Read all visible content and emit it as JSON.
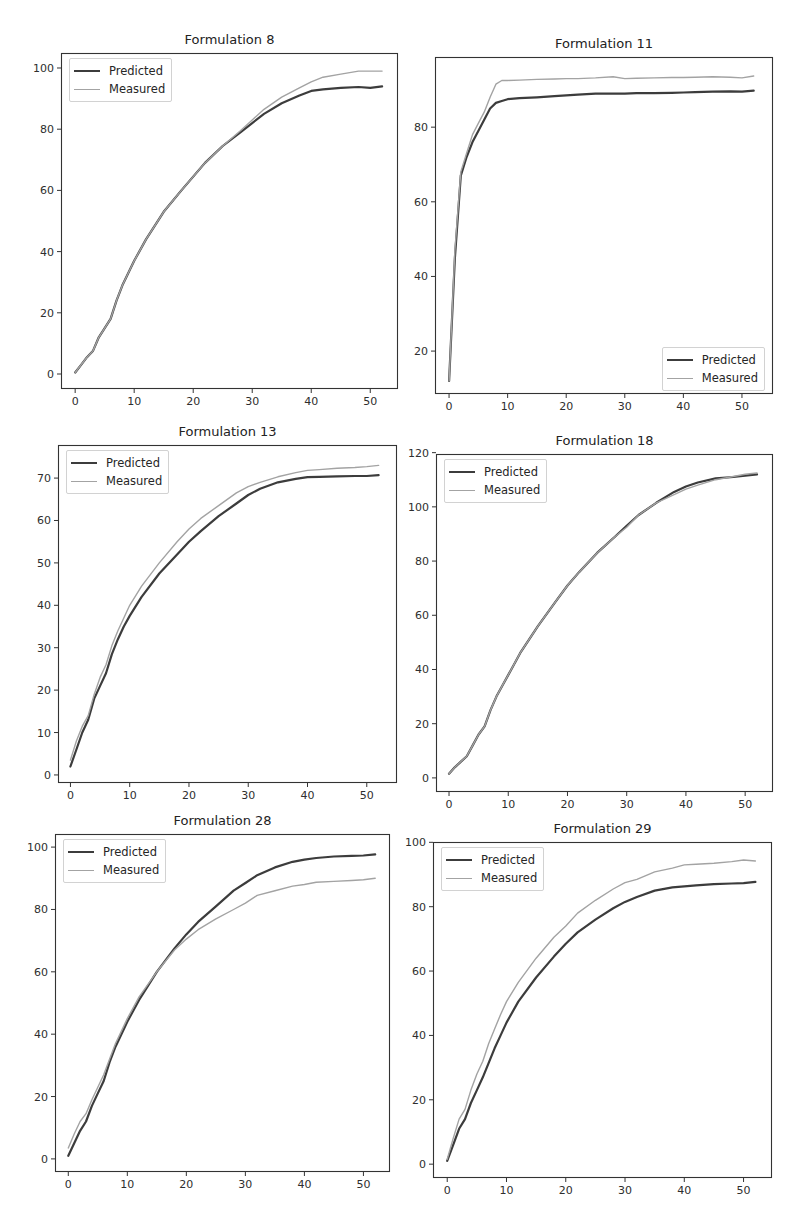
{
  "figure": {
    "layout": "3 rows x 2 columns grid of line plots",
    "series_colors": {
      "Predicted": "#3c3c3c",
      "Measured": "#a3a3a3"
    }
  },
  "chart_data": [
    {
      "type": "line",
      "title": "Formulation 8",
      "xlabel": "",
      "ylabel": "",
      "grid": false,
      "legend_position": "upper left",
      "xlim": [
        -2.4,
        54.7
      ],
      "ylim": [
        -4.9,
        104.9
      ],
      "xticks": [
        0,
        10,
        20,
        30,
        40,
        50
      ],
      "yticks": [
        0,
        20,
        40,
        60,
        80,
        100
      ],
      "x": [
        0,
        1,
        2,
        3,
        4,
        5,
        6,
        7,
        8,
        9,
        10,
        12,
        15,
        18,
        20,
        22,
        25,
        28,
        30,
        32,
        35,
        38,
        40,
        42,
        45,
        48,
        50,
        52
      ],
      "series": [
        {
          "name": "Predicted",
          "color": "#3c3c3c",
          "width": 2.2,
          "values": [
            0.5,
            3,
            5.5,
            7.5,
            12,
            15,
            18,
            24,
            29,
            33,
            37,
            44,
            53,
            60,
            64.5,
            69,
            74.5,
            79,
            82,
            85,
            88.5,
            91,
            92.5,
            93,
            93.5,
            93.8,
            93.5,
            94
          ]
        },
        {
          "name": "Measured",
          "color": "#a3a3a3",
          "width": 1.4,
          "values": [
            0.5,
            3,
            5.5,
            7.5,
            12,
            15,
            18,
            24,
            29,
            33,
            37,
            44,
            53,
            60,
            64.5,
            69,
            74.5,
            79.5,
            83,
            86.5,
            90.5,
            93.5,
            95.5,
            97,
            98,
            99,
            99,
            99
          ]
        }
      ]
    },
    {
      "type": "line",
      "title": "Formulation 11",
      "xlabel": "",
      "ylabel": "",
      "grid": false,
      "legend_position": "lower right",
      "xlim": [
        -2.4,
        55.3
      ],
      "ylim": [
        8.5,
        98.8
      ],
      "xticks": [
        0,
        10,
        20,
        30,
        40,
        50
      ],
      "yticks": [
        20,
        40,
        60,
        80
      ],
      "x": [
        0,
        1,
        2,
        3,
        4,
        5,
        6,
        7,
        8,
        9,
        10,
        12,
        15,
        18,
        20,
        22,
        25,
        28,
        30,
        32,
        35,
        38,
        40,
        42,
        45,
        48,
        50,
        52
      ],
      "series": [
        {
          "name": "Predicted",
          "color": "#3c3c3c",
          "width": 2.2,
          "values": [
            12,
            45,
            67,
            72,
            76,
            79,
            82,
            85,
            86.5,
            87,
            87.5,
            87.8,
            88,
            88.3,
            88.5,
            88.7,
            89,
            89,
            89,
            89.1,
            89.1,
            89.2,
            89.3,
            89.4,
            89.5,
            89.6,
            89.5,
            89.8
          ]
        },
        {
          "name": "Measured",
          "color": "#a3a3a3",
          "width": 1.4,
          "values": [
            12,
            47,
            68,
            73,
            78,
            81,
            84,
            88,
            91.5,
            92.5,
            92.5,
            92.6,
            92.8,
            92.9,
            93,
            93,
            93.2,
            93.5,
            93,
            93.1,
            93.2,
            93.3,
            93.3,
            93.4,
            93.5,
            93.4,
            93.2,
            93.7
          ]
        }
      ]
    },
    {
      "type": "line",
      "title": "Formulation 13",
      "xlabel": "",
      "ylabel": "",
      "grid": false,
      "legend_position": "upper left",
      "xlim": [
        -2.1,
        55.1
      ],
      "ylim": [
        -1.9,
        77.8
      ],
      "xticks": [
        0,
        10,
        20,
        30,
        40,
        50
      ],
      "yticks": [
        0,
        10,
        20,
        30,
        40,
        50,
        60,
        70
      ],
      "x": [
        0,
        1,
        2,
        3,
        4,
        5,
        6,
        7,
        8,
        9,
        10,
        12,
        15,
        18,
        20,
        22,
        25,
        28,
        30,
        32,
        35,
        38,
        40,
        42,
        45,
        48,
        50,
        52
      ],
      "series": [
        {
          "name": "Predicted",
          "color": "#3c3c3c",
          "width": 2.2,
          "values": [
            2,
            6,
            10,
            13,
            18,
            21,
            24,
            28.5,
            32,
            35,
            37.5,
            42,
            47.5,
            52,
            55,
            57.5,
            61,
            64,
            66,
            67.5,
            69,
            69.8,
            70.2,
            70.3,
            70.4,
            70.5,
            70.5,
            70.7
          ]
        },
        {
          "name": "Measured",
          "color": "#a3a3a3",
          "width": 1.4,
          "values": [
            3.5,
            8,
            11.5,
            14,
            19,
            23,
            26,
            30.5,
            34,
            37,
            40,
            44.5,
            50,
            55,
            58,
            60.5,
            63.5,
            66.5,
            68,
            69,
            70.3,
            71.3,
            71.8,
            72,
            72.3,
            72.5,
            72.7,
            73
          ]
        }
      ]
    },
    {
      "type": "line",
      "title": "Formulation 18",
      "xlabel": "",
      "ylabel": "",
      "grid": false,
      "legend_position": "upper left",
      "xlim": [
        -2.2,
        54.7
      ],
      "ylim": [
        -5.2,
        119.5
      ],
      "xticks": [
        0,
        10,
        20,
        30,
        40,
        50
      ],
      "yticks": [
        0,
        20,
        40,
        60,
        80,
        100,
        120
      ],
      "x": [
        0,
        1,
        2,
        3,
        4,
        5,
        6,
        7,
        8,
        9,
        10,
        12,
        15,
        18,
        20,
        22,
        25,
        28,
        30,
        32,
        35,
        38,
        40,
        42,
        45,
        48,
        50,
        52
      ],
      "series": [
        {
          "name": "Predicted",
          "color": "#3c3c3c",
          "width": 2.2,
          "values": [
            1.5,
            4,
            6,
            8,
            12,
            16,
            19,
            25,
            30,
            34,
            38,
            46,
            56,
            65,
            71,
            76,
            83,
            89,
            93,
            97,
            101.5,
            105.5,
            107.5,
            109,
            110.5,
            111,
            111.5,
            112
          ]
        },
        {
          "name": "Measured",
          "color": "#a3a3a3",
          "width": 1.4,
          "values": [
            1.5,
            4,
            6,
            8,
            12,
            16,
            19,
            25,
            30,
            34,
            38,
            46,
            56,
            65,
            71,
            76,
            83,
            89,
            92.5,
            97,
            101.5,
            104.5,
            106.5,
            108,
            110,
            111.2,
            112,
            112.5
          ]
        }
      ]
    },
    {
      "type": "line",
      "title": "Formulation 28",
      "xlabel": "",
      "ylabel": "",
      "grid": false,
      "legend_position": "upper left",
      "xlim": [
        -2.25,
        54.5
      ],
      "ylim": [
        -4.2,
        104.2
      ],
      "xticks": [
        0,
        10,
        20,
        30,
        40,
        50
      ],
      "yticks": [
        0,
        20,
        40,
        60,
        80,
        100
      ],
      "x": [
        0,
        1,
        2,
        3,
        4,
        5,
        6,
        7,
        8,
        9,
        10,
        12,
        15,
        18,
        20,
        22,
        25,
        28,
        30,
        32,
        35,
        38,
        40,
        42,
        45,
        48,
        50,
        52
      ],
      "series": [
        {
          "name": "Predicted",
          "color": "#3c3c3c",
          "width": 2.2,
          "values": [
            1,
            5,
            9,
            12,
            17,
            21,
            25,
            31,
            36,
            40,
            44,
            51,
            60,
            67.5,
            72,
            76,
            81,
            86,
            88.5,
            91,
            93.5,
            95.3,
            96,
            96.5,
            97,
            97.2,
            97.3,
            97.7
          ]
        },
        {
          "name": "Measured",
          "color": "#a3a3a3",
          "width": 1.4,
          "values": [
            3.5,
            8,
            12,
            14.5,
            19,
            23,
            27,
            32,
            37,
            41,
            45,
            52,
            60,
            67,
            70.5,
            73.5,
            77,
            80,
            82,
            84.5,
            86,
            87.5,
            88,
            88.7,
            89,
            89.3,
            89.5,
            90
          ]
        }
      ]
    },
    {
      "type": "line",
      "title": "Formulation 29",
      "xlabel": "",
      "ylabel": "",
      "grid": false,
      "legend_position": "upper left",
      "xlim": [
        -2.4,
        54.8
      ],
      "ylim": [
        -4.3,
        100.1
      ],
      "xticks": [
        0,
        10,
        20,
        30,
        40,
        50
      ],
      "yticks": [
        0,
        20,
        40,
        60,
        80,
        100
      ],
      "x": [
        0,
        1,
        2,
        3,
        4,
        5,
        6,
        7,
        8,
        9,
        10,
        12,
        15,
        18,
        20,
        22,
        25,
        28,
        30,
        32,
        35,
        38,
        40,
        42,
        45,
        48,
        50,
        52
      ],
      "series": [
        {
          "name": "Predicted",
          "color": "#3c3c3c",
          "width": 2.2,
          "values": [
            1,
            6,
            11,
            14,
            19,
            23,
            27,
            31.5,
            36,
            40,
            44,
            50.5,
            58,
            64.5,
            68.5,
            72,
            76,
            79.5,
            81.5,
            83,
            85,
            86,
            86.3,
            86.6,
            87,
            87.2,
            87.3,
            87.7
          ]
        },
        {
          "name": "Measured",
          "color": "#a3a3a3",
          "width": 1.4,
          "values": [
            1.5,
            8,
            14,
            17,
            23,
            28,
            32,
            37.5,
            42,
            46.5,
            50.5,
            56.5,
            64,
            70.5,
            74,
            78,
            82,
            85.5,
            87.5,
            88.5,
            90.8,
            92,
            93,
            93.2,
            93.5,
            94,
            94.5,
            94.2
          ]
        }
      ]
    }
  ]
}
